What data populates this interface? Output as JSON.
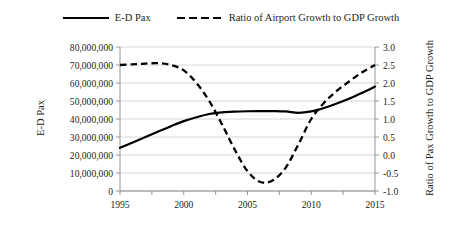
{
  "legend": {
    "position": "top-center",
    "entries": [
      {
        "label": "E-D Pax",
        "style": "solid"
      },
      {
        "label": "Ratio of Airport Growth to GDP Growth",
        "style": "dashed"
      }
    ]
  },
  "axes": {
    "y_left": {
      "title": "E-D Pax",
      "ticks": [
        "0",
        "10,000,000",
        "20,000,000",
        "30,000,000",
        "40,000,000",
        "50,000,000",
        "60,000,000",
        "70,000,000",
        "80,000,000"
      ],
      "min": 0,
      "max": 80000000
    },
    "y_right": {
      "title": "Ratio of Pax Growth to GDP Growth",
      "ticks": [
        "-1.0",
        "-0.5",
        "0.0",
        "0.5",
        "1.0",
        "1.5",
        "2.0",
        "2.5",
        "3.0"
      ],
      "min": -1.0,
      "max": 3.0
    },
    "x": {
      "title": "",
      "ticks": [
        "1995",
        "2000",
        "2005",
        "2010",
        "2015"
      ],
      "min": 1995,
      "max": 2015
    }
  },
  "chart_data": {
    "type": "line",
    "title": "",
    "xlabel": "",
    "ylabel": "E-D Pax",
    "y2label": "Ratio of Pax Growth to GDP Growth",
    "xlim": [
      1995,
      2015
    ],
    "ylim": [
      0,
      80000000
    ],
    "y2lim": [
      -1.0,
      3.0
    ],
    "grid": "horizontal",
    "legend_position": "top-center",
    "x": [
      1995,
      1996,
      1997,
      1998,
      1999,
      2000,
      2001,
      2002,
      2003,
      2004,
      2005,
      2006,
      2007,
      2008,
      2009,
      2010,
      2011,
      2012,
      2013,
      2014,
      2015
    ],
    "series": [
      {
        "name": "E-D Pax",
        "axis": "left",
        "style": "solid",
        "color": "#000000",
        "values": [
          24000000,
          27000000,
          30000000,
          33000000,
          36000000,
          38800000,
          41000000,
          42800000,
          43700000,
          44100000,
          44300000,
          44400000,
          44400000,
          44200000,
          43400000,
          44200000,
          46100000,
          48600000,
          51400000,
          54600000,
          58000000
        ]
      },
      {
        "name": "Ratio of Airport Growth to GDP Growth",
        "axis": "right",
        "style": "dashed",
        "color": "#000000",
        "values": [
          2.5,
          2.52,
          2.54,
          2.55,
          2.5,
          2.35,
          2.0,
          1.5,
          0.85,
          0.15,
          -0.45,
          -0.75,
          -0.7,
          -0.35,
          0.3,
          1.0,
          1.45,
          1.78,
          2.05,
          2.3,
          2.5
        ]
      }
    ]
  }
}
